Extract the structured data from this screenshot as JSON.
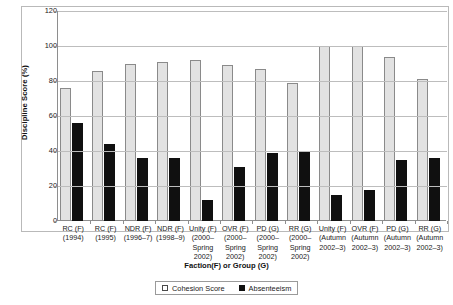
{
  "chart_data": {
    "type": "bar",
    "title": "",
    "subtitle": "",
    "xlabel": "Faction(F) or Group (G)",
    "ylabel": "Discipline Score (%)",
    "ylim": [
      0,
      120
    ],
    "y_ticks": [
      0,
      20,
      40,
      60,
      80,
      100,
      120
    ],
    "grid": true,
    "legend_position": "bottom",
    "categories": [
      "RC (F)\n(1994)",
      "RC (F)\n(1995)",
      "NDR (F)\n(1996–7)",
      "NDR (F)\n(1998–9)",
      "Unity (F)\n(2000–\nSpring\n2002)",
      "OVR (F)\n(2000–\nSpring\n2002)",
      "PD (G)\n(2000–\nSpring\n2002)",
      "RR (G)\n(2000–\nSpring\n2002)",
      "Unity (F)\n(Autumn\n2002–3)",
      "OVR (F)\n(Autumn\n2002–3)",
      "PD (G)\n(Autumn\n2002–3)",
      "RR (G)\n(Autumn\n2002–3)"
    ],
    "category_lines": [
      [
        "RC (F)",
        "(1994)"
      ],
      [
        "RC (F)",
        "(1995)"
      ],
      [
        "NDR (F)",
        "(1996–7)"
      ],
      [
        "NDR (F)",
        "(1998–9)"
      ],
      [
        "Unity (F)",
        "(2000–",
        "Spring",
        "2002)"
      ],
      [
        "OVR (F)",
        "(2000–",
        "Spring",
        "2002)"
      ],
      [
        "PD (G)",
        "(2000–",
        "Spring",
        "2002)"
      ],
      [
        "RR (G)",
        "(2000–",
        "Spring",
        "2002)"
      ],
      [
        "Unity (F)",
        "(Autumn",
        "2002–3)"
      ],
      [
        "OVR (F)",
        "(Autumn",
        "2002–3)"
      ],
      [
        "PD (G)",
        "(Autumn",
        "2002–3)"
      ],
      [
        "RR (G)",
        "(Autumn",
        "2002–3)"
      ]
    ],
    "series": [
      {
        "name": "Cohesion Score",
        "color": "#e2e2e2",
        "values": [
          76,
          86,
          90,
          91,
          92,
          89,
          87,
          79,
          100,
          100,
          94,
          81
        ]
      },
      {
        "name": "Absenteeism",
        "color": "#101010",
        "values": [
          56,
          44,
          36,
          36,
          12,
          31,
          39,
          40,
          15,
          18,
          35,
          36
        ]
      }
    ]
  },
  "legend": {
    "items": [
      {
        "label": "Cohesion Score",
        "swatch": "hollow-square-icon"
      },
      {
        "label": "Absenteeism",
        "swatch": "filled-square-icon"
      }
    ]
  },
  "axes": {
    "y_title": "Discipline Score (%)",
    "x_title": "Faction(F) or Group (G)",
    "y_tick_labels": [
      "0",
      "20",
      "40",
      "60",
      "80",
      "100",
      "120"
    ]
  }
}
